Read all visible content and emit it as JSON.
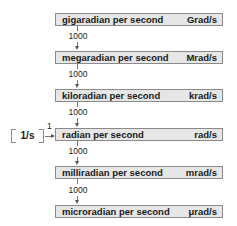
{
  "diagram": {
    "units": [
      {
        "name": "gigaradian per second",
        "symbol": "Grad/s"
      },
      {
        "name": "megaradian per second",
        "symbol": "Mrad/s"
      },
      {
        "name": "kiloradian per second",
        "symbol": "krad/s"
      },
      {
        "name": "radian per second",
        "symbol": "rad/s"
      },
      {
        "name": "milliradian per second",
        "symbol": "mrad/s"
      },
      {
        "name": "microradian per second",
        "symbol": "μrad/s"
      }
    ],
    "factors": [
      "1000",
      "1000",
      "1000",
      "1000",
      "1000"
    ],
    "base": {
      "label": "1/s",
      "factor": "1"
    },
    "colors": {
      "box_fill": "#e6e6e6",
      "box_border": "#8a8a8a",
      "line": "#777777"
    }
  }
}
